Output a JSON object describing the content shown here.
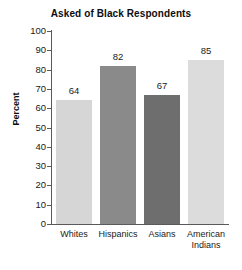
{
  "chart_data": {
    "type": "bar",
    "title": "Asked of Black Respondents",
    "xlabel": "",
    "ylabel": "Percent",
    "categories": [
      "Whites",
      "Hispanics",
      "Asians",
      "American Indians"
    ],
    "values": [
      64,
      82,
      67,
      85
    ],
    "value_labels": [
      "64",
      "82",
      "67",
      "85"
    ],
    "ylim": [
      0,
      100
    ],
    "yticks": [
      0,
      10,
      20,
      30,
      40,
      50,
      60,
      70,
      80,
      90,
      100
    ],
    "ytick_labels": [
      "0",
      "10",
      "20",
      "30",
      "40",
      "50",
      "60",
      "70",
      "80",
      "90",
      "100"
    ],
    "grid": false,
    "legend": false,
    "bar_colors": [
      "#d6d6d6",
      "#8a8a8a",
      "#6e6e6e",
      "#dcdcdc"
    ],
    "axis_color": "#5a5a5a",
    "text_color": "#1a1a1a",
    "background": "#ffffff"
  },
  "category_label_lines": [
    [
      "Whites"
    ],
    [
      "Hispanics"
    ],
    [
      "Asians"
    ],
    [
      "American",
      "Indians"
    ]
  ]
}
